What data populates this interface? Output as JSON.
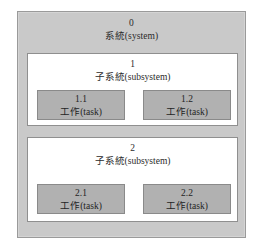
{
  "diagram": {
    "system": {
      "index": "0",
      "name": "系統(system)",
      "fill_color": "#c9c9c9",
      "border_color": "#9a9a9a"
    },
    "subsystems": [
      {
        "index": "1",
        "name": "子系統(subsystem)",
        "fill_color": "#ffffff",
        "border_color": "#8f8f8f",
        "tasks": [
          {
            "index": "1.1",
            "name": "工作(task)"
          },
          {
            "index": "1.2",
            "name": "工作(task)"
          }
        ]
      },
      {
        "index": "2",
        "name": "子系統(subsystem)",
        "fill_color": "#ffffff",
        "border_color": "#8f8f8f",
        "tasks": [
          {
            "index": "2.1",
            "name": "工作(task)"
          },
          {
            "index": "2.2",
            "name": "工作(task)"
          }
        ]
      }
    ],
    "task_style": {
      "fill_color": "#b1b1b1",
      "border_color": "#8a8a8a"
    }
  }
}
